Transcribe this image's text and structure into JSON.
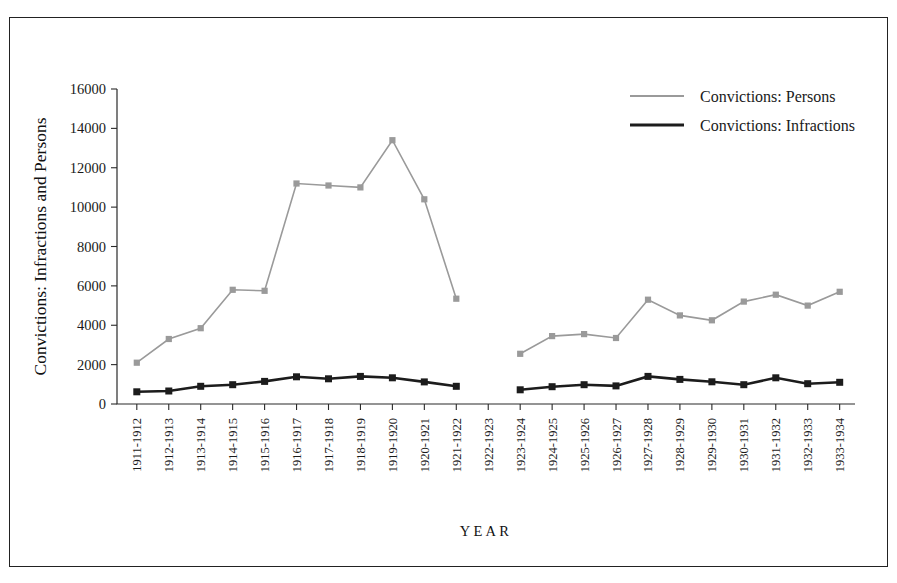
{
  "chart_data": {
    "type": "line",
    "title": "",
    "xlabel": "YEAR",
    "ylabel": "Convictions: Infractions and Persons",
    "ylim": [
      0,
      16000
    ],
    "yticks": [
      0,
      2000,
      4000,
      6000,
      8000,
      10000,
      12000,
      14000,
      16000
    ],
    "ytick_labels": [
      "0",
      "2000",
      "4000",
      "6000",
      "8000",
      "10000",
      "12000",
      "14000",
      "16000"
    ],
    "grid": false,
    "legend_position": "top-right",
    "categories": [
      "1911-1912",
      "1912-1913",
      "1913-1914",
      "1914-1915",
      "1915-1916",
      "1916-1917",
      "1917-1918",
      "1918-1919",
      "1919-1920",
      "1920-1921",
      "1921-1922",
      "1922-1923",
      "1923-1924",
      "1924-1925",
      "1925-1926",
      "1926-1927",
      "1927-1928",
      "1928-1929",
      "1929-1930",
      "1930-1931",
      "1931-1932",
      "1932-1933",
      "1933-1934"
    ],
    "series": [
      {
        "name": "Convictions: Persons",
        "color": "#9a9a9a",
        "marker": "square",
        "values": [
          2100,
          3300,
          3850,
          5800,
          5750,
          11200,
          11100,
          11000,
          13400,
          10400,
          5350,
          null,
          2550,
          3450,
          3550,
          3350,
          5300,
          4500,
          4250,
          5200,
          5550,
          5000,
          5700
        ]
      },
      {
        "name": "Convictions: Infractions",
        "color": "#1c1c1c",
        "marker": "square",
        "values": [
          620,
          660,
          900,
          980,
          1150,
          1380,
          1280,
          1400,
          1330,
          1120,
          900,
          null,
          720,
          880,
          980,
          920,
          1400,
          1250,
          1130,
          980,
          1330,
          1030,
          1100
        ]
      }
    ]
  },
  "legend": {
    "items": [
      {
        "label": "Convictions: Persons"
      },
      {
        "label": "Convictions: Infractions"
      }
    ]
  }
}
